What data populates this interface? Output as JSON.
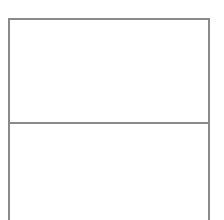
{
  "diagram": {
    "type": "stacked-panels-wireframe",
    "stroke_color": "#8a8a8a",
    "background_color": "#ffffff",
    "panels": [
      {
        "id": "top",
        "label": ""
      },
      {
        "id": "bottom",
        "label": ""
      }
    ]
  }
}
